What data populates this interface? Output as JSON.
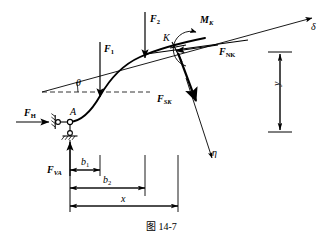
{
  "figure": {
    "caption": "图 14-7",
    "point_labels": {
      "support": "A",
      "section": "K"
    },
    "forces": [
      {
        "id": "F_H",
        "base": "F",
        "sub": "H",
        "label_text": "F",
        "sub_text": "H",
        "description": "horizontal support reaction at A, pointing right"
      },
      {
        "id": "F_VA",
        "base": "F",
        "sub": "VA",
        "label_text": "F",
        "sub_text": "VA",
        "description": "vertical support reaction at A, pointing up"
      },
      {
        "id": "F_1",
        "base": "F",
        "sub": "1",
        "label_text": "F",
        "sub_text": "1",
        "description": "applied vertical load, pointing down"
      },
      {
        "id": "F_2",
        "base": "F",
        "sub": "2",
        "label_text": "F",
        "sub_text": "2",
        "description": "applied vertical load, pointing down"
      },
      {
        "id": "F_NK",
        "base": "F",
        "sub": "NK",
        "label_text": "F",
        "sub_text": "NK",
        "description": "normal internal force at section K, along arch axis"
      },
      {
        "id": "F_SK",
        "base": "F",
        "sub": "SK",
        "label_text": "F",
        "sub_text": "SK",
        "description": "shear internal force at section K, perpendicular to arch axis"
      }
    ],
    "moment": {
      "id": "M_K",
      "label_text": "M",
      "sub_text": "K",
      "description": "internal bending moment at section K, counterclockwise"
    },
    "axes": [
      {
        "id": "delta",
        "label_text": "δ",
        "description": "tangential axis at K pointing up-right"
      },
      {
        "id": "eta",
        "label_text": "η",
        "description": "normal axis at K pointing down-right"
      }
    ],
    "angle": {
      "id": "theta",
      "label_text": "θ",
      "description": "inclination of the arch tangent to the horizontal"
    },
    "dimensions": [
      {
        "id": "b1",
        "label_text": "b",
        "sub_text": "1",
        "description": "horizontal distance from A to F_1"
      },
      {
        "id": "b2",
        "label_text": "b",
        "sub_text": "2",
        "description": "horizontal distance from A to F_2"
      },
      {
        "id": "x",
        "label_text": "x",
        "sub_text": "",
        "description": "horizontal distance from A to section K"
      },
      {
        "id": "y",
        "label_text": "y",
        "sub_text": "",
        "description": "vertical rise of section K above A"
      }
    ],
    "colors": {
      "ink": "#000000",
      "background": "#ffffff",
      "thin_line": "#1a1a1a"
    }
  }
}
